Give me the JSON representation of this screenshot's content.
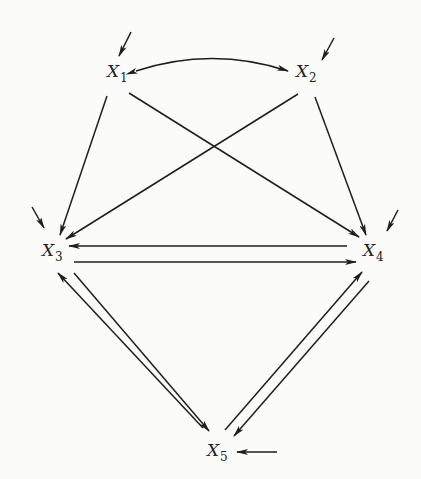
{
  "diagram": {
    "type": "path-diagram",
    "nodes": [
      {
        "id": "X1",
        "var": "X",
        "sub": "1",
        "x": 110,
        "y": 73
      },
      {
        "id": "X2",
        "var": "X",
        "sub": "2",
        "x": 296,
        "y": 73
      },
      {
        "id": "X3",
        "var": "X",
        "sub": "3",
        "x": 42,
        "y": 250
      },
      {
        "id": "X4",
        "var": "X",
        "sub": "4",
        "x": 363,
        "y": 250
      },
      {
        "id": "X5",
        "var": "X",
        "sub": "5",
        "x": 207,
        "y": 448
      }
    ],
    "edges": [
      {
        "from": "X1",
        "to": "X2",
        "kind": "curved-bidirectional"
      },
      {
        "from": "X1",
        "to": "X3",
        "kind": "directed"
      },
      {
        "from": "X1",
        "to": "X4",
        "kind": "directed"
      },
      {
        "from": "X2",
        "to": "X3",
        "kind": "directed"
      },
      {
        "from": "X2",
        "to": "X4",
        "kind": "directed"
      },
      {
        "from": "X4",
        "to": "X3",
        "kind": "directed"
      },
      {
        "from": "X3",
        "to": "X4",
        "kind": "directed"
      },
      {
        "from": "X3",
        "to": "X5",
        "kind": "directed"
      },
      {
        "from": "X5",
        "to": "X3",
        "kind": "directed"
      },
      {
        "from": "X4",
        "to": "X5",
        "kind": "directed"
      },
      {
        "from": "X5",
        "to": "X4",
        "kind": "directed"
      }
    ],
    "disturbances": [
      {
        "to": "X1",
        "direction": "from upper-right"
      },
      {
        "to": "X2",
        "direction": "from upper-right"
      },
      {
        "to": "X3",
        "direction": "from upper-left"
      },
      {
        "to": "X4",
        "direction": "from upper-right"
      },
      {
        "to": "X5",
        "direction": "from right"
      }
    ],
    "colors": {
      "ink": "#1e1e1e",
      "background": "#fbfbfa"
    }
  }
}
